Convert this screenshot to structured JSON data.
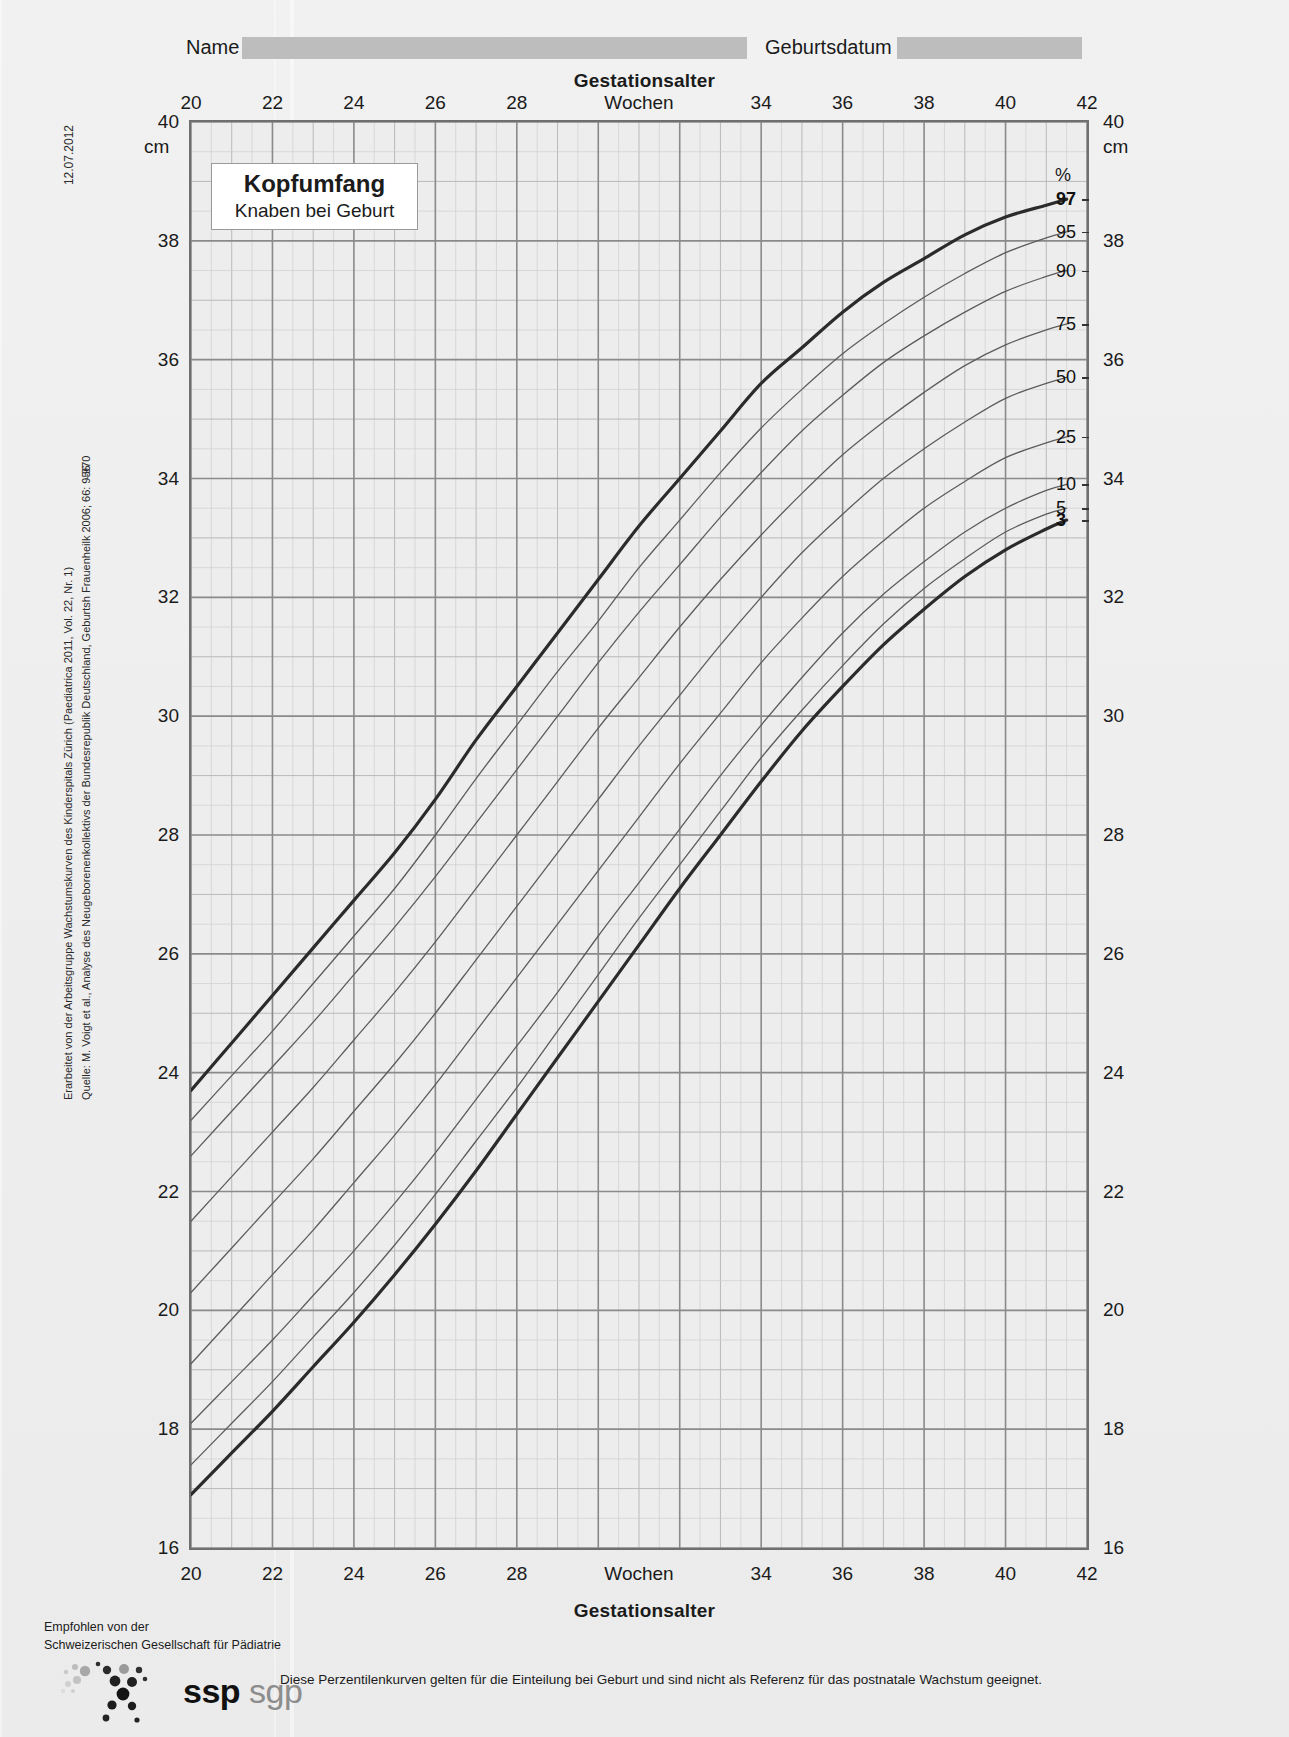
{
  "header": {
    "name_label": "Name",
    "birthdate_label": "Geburtsdatum",
    "date_stamp": "12.07.2012"
  },
  "title_box": {
    "title": "Kopfumfang",
    "subtitle": "Knaben bei Geburt"
  },
  "axis_titles": {
    "x_top": "Gestationsalter",
    "x_bottom": "Gestationsalter",
    "x_unit_word": "Wochen",
    "y_unit": "cm",
    "percent_symbol": "%"
  },
  "side_notes": {
    "line1": "Erarbeitet von der Arbeitsgruppe Wachstumskurven des Kinderspitals Zürich (Paediatrica 2011, Vol. 22, Nr. 1)",
    "line2": "Quelle: M. Voigt et al., Analyse des Neugeborenenkollektivs der Bundesrepublik Deutschland, Geburtsh Frauenheilk 2006; 66: 956",
    "line2_tail": "–970"
  },
  "footer": {
    "recommended_line1": "Empfohlen von der",
    "recommended_line2": "Schweizerischen Gesellschaft für Pädiatrie",
    "logo_primary": "ssp",
    "logo_secondary": "sgp",
    "disclaimer": "Diese Perzentilenkurven gelten für die Einteilung bei Geburt und sind nicht als Referenz für das postnatale Wachstum geeignet."
  },
  "colors": {
    "paper": "#ededed",
    "grid_major": "#8a8a8a",
    "grid_minor": "#b9b9b9",
    "grid_fine": "#cfcfcf",
    "axis": "#6f6f6f",
    "curve_outer": "#2b2b2b",
    "curve_inner": "#5c5c5c",
    "field_fill": "#bdbdbd"
  },
  "chart_data": {
    "type": "line",
    "title": "Kopfumfang",
    "subtitle": "Knaben bei Geburt",
    "xlabel": "Gestationsalter (Wochen)",
    "ylabel": "cm",
    "xlim": [
      20,
      42
    ],
    "ylim": [
      16,
      40
    ],
    "grid": true,
    "x_major_step": 2,
    "x_minor_step": 0.5,
    "y_major_step": 2,
    "y_minor_step": 0.5,
    "xticks": [
      20,
      22,
      24,
      26,
      28,
      "Wochen",
      34,
      36,
      38,
      40,
      42
    ],
    "xtick_values": [
      20,
      22,
      24,
      26,
      28,
      31,
      34,
      36,
      38,
      40,
      42
    ],
    "yticks": [
      16,
      18,
      20,
      22,
      24,
      26,
      28,
      30,
      32,
      34,
      36,
      38,
      40
    ],
    "legend_position": "right-outside",
    "legend_title": "%",
    "x": [
      20,
      21,
      22,
      23,
      24,
      25,
      26,
      27,
      28,
      29,
      30,
      31,
      32,
      33,
      34,
      35,
      36,
      37,
      38,
      39,
      40,
      41,
      41.5
    ],
    "series": [
      {
        "name": "97",
        "label": "97",
        "emphasis": true,
        "values": [
          23.7,
          24.5,
          25.3,
          26.1,
          26.9,
          27.7,
          28.6,
          29.6,
          30.5,
          31.4,
          32.3,
          33.2,
          34.0,
          34.8,
          35.6,
          36.2,
          36.8,
          37.3,
          37.7,
          38.1,
          38.4,
          38.6,
          38.7
        ]
      },
      {
        "name": "95",
        "label": "95",
        "emphasis": false,
        "values": [
          23.2,
          23.95,
          24.7,
          25.5,
          26.3,
          27.1,
          28.0,
          28.95,
          29.85,
          30.75,
          31.6,
          32.5,
          33.3,
          34.1,
          34.85,
          35.5,
          36.1,
          36.6,
          37.05,
          37.45,
          37.8,
          38.05,
          38.15
        ]
      },
      {
        "name": "90",
        "label": "90",
        "emphasis": false,
        "values": [
          22.6,
          23.35,
          24.1,
          24.85,
          25.65,
          26.45,
          27.3,
          28.2,
          29.1,
          30.0,
          30.9,
          31.75,
          32.55,
          33.35,
          34.1,
          34.8,
          35.4,
          35.95,
          36.4,
          36.8,
          37.15,
          37.4,
          37.5
        ]
      },
      {
        "name": "75",
        "label": "75",
        "emphasis": false,
        "values": [
          21.5,
          22.25,
          23.0,
          23.75,
          24.55,
          25.35,
          26.2,
          27.1,
          28.0,
          28.9,
          29.8,
          30.65,
          31.5,
          32.3,
          33.05,
          33.75,
          34.4,
          34.95,
          35.45,
          35.9,
          36.25,
          36.5,
          36.6
        ]
      },
      {
        "name": "50",
        "label": "50",
        "emphasis": false,
        "values": [
          20.3,
          21.05,
          21.8,
          22.55,
          23.35,
          24.15,
          25.0,
          25.9,
          26.8,
          27.7,
          28.6,
          29.5,
          30.35,
          31.2,
          32.0,
          32.75,
          33.4,
          34.0,
          34.5,
          34.95,
          35.35,
          35.6,
          35.7
        ]
      },
      {
        "name": "25",
        "label": "25",
        "emphasis": false,
        "values": [
          19.1,
          19.85,
          20.6,
          21.35,
          22.15,
          22.95,
          23.8,
          24.7,
          25.6,
          26.5,
          27.4,
          28.3,
          29.2,
          30.05,
          30.9,
          31.65,
          32.35,
          32.95,
          33.5,
          33.95,
          34.35,
          34.6,
          34.7
        ]
      },
      {
        "name": "10",
        "label": "10",
        "emphasis": false,
        "values": [
          18.1,
          18.8,
          19.5,
          20.25,
          21.0,
          21.8,
          22.65,
          23.55,
          24.45,
          25.35,
          26.3,
          27.2,
          28.1,
          29.0,
          29.85,
          30.65,
          31.4,
          32.05,
          32.6,
          33.1,
          33.5,
          33.8,
          33.9
        ]
      },
      {
        "name": "5",
        "label": "5",
        "emphasis": false,
        "values": [
          17.4,
          18.1,
          18.8,
          19.55,
          20.3,
          21.1,
          21.95,
          22.85,
          23.75,
          24.7,
          25.65,
          26.6,
          27.5,
          28.4,
          29.3,
          30.1,
          30.85,
          31.55,
          32.15,
          32.65,
          33.1,
          33.4,
          33.5
        ]
      },
      {
        "name": "3",
        "label": "3",
        "emphasis": true,
        "values": [
          16.9,
          17.6,
          18.3,
          19.05,
          19.8,
          20.6,
          21.45,
          22.35,
          23.3,
          24.25,
          25.2,
          26.15,
          27.1,
          28.0,
          28.9,
          29.75,
          30.5,
          31.2,
          31.8,
          32.35,
          32.8,
          33.15,
          33.3
        ]
      }
    ]
  }
}
